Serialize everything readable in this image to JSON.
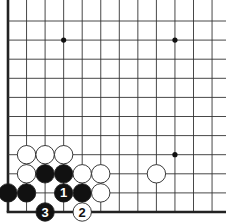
{
  "diagram": {
    "type": "go-board-fragment",
    "corner": "bottom-left",
    "grid": {
      "origin_x": 8,
      "origin_y": 212,
      "spacing_x": 18.55,
      "spacing_y": 19.1,
      "cols": 12,
      "rows": 11
    },
    "star_points": [
      [
        3,
        9
      ],
      [
        9,
        9
      ],
      [
        9,
        3
      ]
    ],
    "stones": [
      {
        "color": "white",
        "col": 1,
        "row": 3,
        "label": ""
      },
      {
        "color": "white",
        "col": 2,
        "row": 3,
        "label": ""
      },
      {
        "color": "white",
        "col": 3,
        "row": 3,
        "label": ""
      },
      {
        "color": "white",
        "col": 1,
        "row": 2,
        "label": ""
      },
      {
        "color": "black",
        "col": 2,
        "row": 2,
        "label": ""
      },
      {
        "color": "black",
        "col": 3,
        "row": 2,
        "label": ""
      },
      {
        "color": "white",
        "col": 4,
        "row": 2,
        "label": ""
      },
      {
        "color": "white",
        "col": 5,
        "row": 2,
        "label": ""
      },
      {
        "color": "white",
        "col": 8,
        "row": 2,
        "label": ""
      },
      {
        "color": "black",
        "col": 0,
        "row": 1,
        "label": ""
      },
      {
        "color": "black",
        "col": 1,
        "row": 1,
        "label": ""
      },
      {
        "color": "black",
        "col": 3,
        "row": 1,
        "label": "1"
      },
      {
        "color": "black",
        "col": 4,
        "row": 1,
        "label": ""
      },
      {
        "color": "white",
        "col": 5,
        "row": 1,
        "label": ""
      },
      {
        "color": "black",
        "col": 2,
        "row": 0,
        "label": "3"
      },
      {
        "color": "white",
        "col": 4,
        "row": 0,
        "label": "2"
      }
    ],
    "colors": {
      "line": "#333333",
      "edge": "#222222",
      "black_stone": "#111111",
      "white_stone": "#ffffff",
      "stone_outline": "#222222"
    }
  }
}
